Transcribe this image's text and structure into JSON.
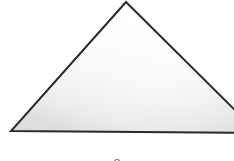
{
  "figure": {
    "title": "",
    "background_color": "#ffffff",
    "width": 234,
    "height": 161,
    "caption_clipped": "o",
    "shape": {
      "name": "triangle",
      "kind": "triangle",
      "stroke_color": "#2a2a2a",
      "stroke_width": 2,
      "fill_light": "#ffffff",
      "fill_mid": "#f2f2f2",
      "fill_dark": "#d9d9d9",
      "vertices": [
        {
          "label": "apex",
          "x": 126,
          "y": 2
        },
        {
          "label": "left-base",
          "x": 11,
          "y": 131
        },
        {
          "label": "right-base",
          "x": 258,
          "y": 133
        }
      ],
      "notes": "Right base vertex extends beyond the right edge of the frame and is clipped."
    }
  }
}
